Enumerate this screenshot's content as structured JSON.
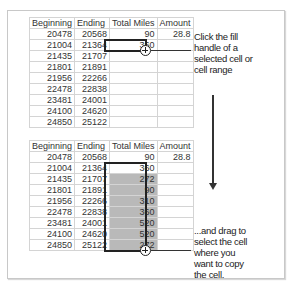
{
  "table_top": {
    "headers": [
      "Beginning",
      "Ending",
      "Total Miles",
      "Amount"
    ],
    "rows": [
      [
        "20478",
        "20568",
        "90",
        "28.8"
      ],
      [
        "21004",
        "21364",
        "360",
        ""
      ],
      [
        "21435",
        "21707",
        "",
        ""
      ],
      [
        "21801",
        "21891",
        "",
        ""
      ],
      [
        "21956",
        "22266",
        "",
        ""
      ],
      [
        "22478",
        "22838",
        "",
        ""
      ],
      [
        "23481",
        "24001",
        "",
        ""
      ],
      [
        "24100",
        "24620",
        "",
        ""
      ],
      [
        "24850",
        "25122",
        "",
        ""
      ]
    ],
    "selected_cell": {
      "row": 2,
      "column": "Total Miles",
      "value": "360"
    }
  },
  "table_bottom": {
    "headers": [
      "Beginning",
      "Ending",
      "Total Miles",
      "Amount"
    ],
    "rows": [
      [
        "20478",
        "20568",
        "90",
        "28.8"
      ],
      [
        "21004",
        "21364",
        "360",
        ""
      ],
      [
        "21435",
        "21707",
        "272",
        ""
      ],
      [
        "21801",
        "21891",
        "90",
        ""
      ],
      [
        "21956",
        "22266",
        "310",
        ""
      ],
      [
        "22478",
        "22838",
        "360",
        ""
      ],
      [
        "23481",
        "24001",
        "520",
        ""
      ],
      [
        "24100",
        "24620",
        "520",
        ""
      ],
      [
        "24850",
        "25122",
        "272",
        ""
      ]
    ],
    "selected_range": {
      "column": "Total Miles",
      "from_row": 2,
      "to_row": 9
    }
  },
  "callouts": {
    "top": [
      "Click the fill",
      "handle of a",
      "selected cell or",
      "cell range"
    ],
    "bottom": [
      "...and drag to",
      "select the cell",
      "where you",
      "want to copy",
      "the cell."
    ]
  },
  "icons": {
    "fill_handle": "crosshair-plus-icon",
    "arrow": "arrow-down-icon"
  },
  "colors": {
    "selection_border": "#222222",
    "fill_range": "#b9b9b9",
    "gridline": "#d4d4d4"
  }
}
